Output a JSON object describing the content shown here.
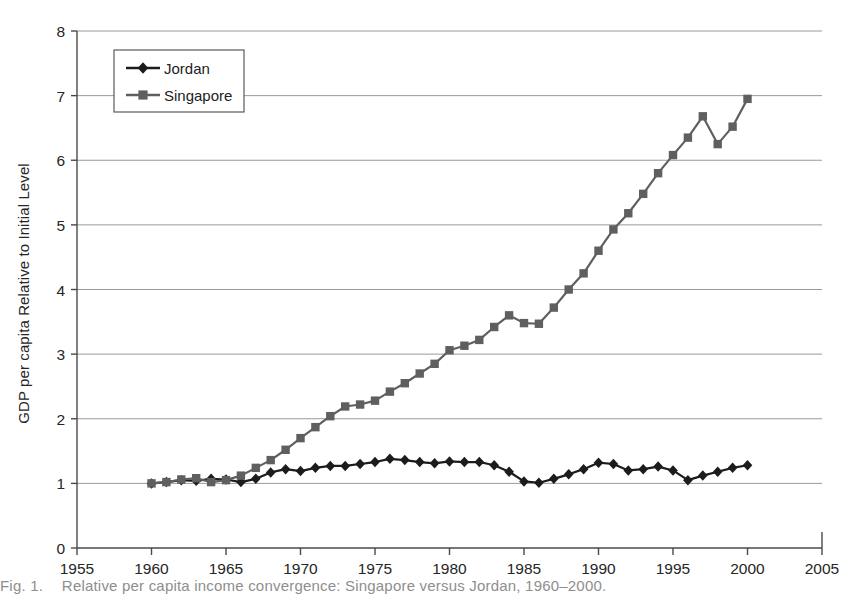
{
  "figure": {
    "caption_prefix": "Fig. 1.",
    "caption_text": "Relative per capita income convergence: Singapore versus Jordan, 1960–2000."
  },
  "axes": {
    "y_title": "GDP per capita Relative to Initial Level",
    "y_ticks": [
      "0",
      "1",
      "2",
      "3",
      "4",
      "5",
      "6",
      "7",
      "8"
    ],
    "x_ticks": [
      "1955",
      "1960",
      "1965",
      "1970",
      "1975",
      "1980",
      "1985",
      "1990",
      "1995",
      "2000",
      "2005"
    ]
  },
  "legend": {
    "position": "upper-left-inside",
    "entries": [
      {
        "label": "Jordan",
        "marker": "diamond",
        "color": "#1c1c1c"
      },
      {
        "label": "Singapore",
        "marker": "square",
        "color": "#5f5f5f"
      }
    ]
  },
  "colors": {
    "jordan": "#1c1c1c",
    "singapore": "#5f5f5f",
    "grid": "#9a9a9a",
    "axis": "#4a4a4a",
    "background": "#ffffff"
  },
  "chart_data": {
    "type": "line",
    "title": "",
    "subtitle": "",
    "xlabel": "",
    "ylabel": "GDP per capita Relative to Initial Level",
    "xlim": [
      1955,
      2005
    ],
    "ylim": [
      0,
      8
    ],
    "xtick_step": 5,
    "ytick_step": 1,
    "grid": "horizontal",
    "legend_position": "upper-left-inside",
    "x": [
      1960,
      1961,
      1962,
      1963,
      1964,
      1965,
      1966,
      1967,
      1968,
      1969,
      1970,
      1971,
      1972,
      1973,
      1974,
      1975,
      1976,
      1977,
      1978,
      1979,
      1980,
      1981,
      1982,
      1983,
      1984,
      1985,
      1986,
      1987,
      1988,
      1989,
      1990,
      1991,
      1992,
      1993,
      1994,
      1995,
      1996,
      1997,
      1998,
      1999,
      2000
    ],
    "series": [
      {
        "name": "Jordan",
        "marker": "diamond",
        "color": "#1c1c1c",
        "values": [
          1.0,
          1.02,
          1.05,
          1.04,
          1.07,
          1.06,
          1.02,
          1.07,
          1.17,
          1.22,
          1.19,
          1.24,
          1.27,
          1.27,
          1.3,
          1.33,
          1.38,
          1.36,
          1.33,
          1.31,
          1.34,
          1.33,
          1.33,
          1.28,
          1.18,
          1.03,
          1.01,
          1.07,
          1.14,
          1.22,
          1.32,
          1.3,
          1.2,
          1.22,
          1.26,
          1.2,
          1.05,
          1.12,
          1.18,
          1.24,
          1.28
        ]
      },
      {
        "name": "Singapore",
        "marker": "square",
        "color": "#5f5f5f",
        "values": [
          1.0,
          1.02,
          1.06,
          1.08,
          1.02,
          1.05,
          1.12,
          1.24,
          1.36,
          1.52,
          1.7,
          1.87,
          2.04,
          2.19,
          2.22,
          2.28,
          2.42,
          2.55,
          2.7,
          2.85,
          3.06,
          3.13,
          3.22,
          3.42,
          3.6,
          3.48,
          3.47,
          3.72,
          4.0,
          4.25,
          4.6,
          4.93,
          5.18,
          5.48,
          5.8,
          6.08,
          6.35,
          6.68,
          6.25,
          6.52,
          6.95
        ]
      }
    ]
  }
}
